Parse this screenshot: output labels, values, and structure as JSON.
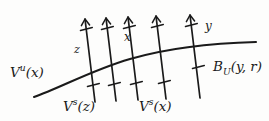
{
  "figure": {
    "kind": "mathematical-diagram",
    "background_color": "#fdfdfc",
    "ink_color": "#1a1a1a",
    "width": 269,
    "height": 121
  },
  "labels": {
    "unstable_manifold": {
      "base": "V",
      "superscript": "u",
      "argument": "(x)",
      "full": "V^u(x)"
    },
    "point_z": "z",
    "point_x": "x",
    "point_y": "y",
    "ball": {
      "base": "B",
      "subscript": "U",
      "argument": "(y, r)",
      "full": "B_U(y,r)"
    },
    "stable_manifold_z": {
      "base": "V",
      "superscript": "s",
      "argument": "(z)",
      "full": "V^s(z)"
    },
    "stable_manifold_x": {
      "base": "V",
      "superscript": "s",
      "argument": "(x)",
      "full": "V^s(x)"
    }
  },
  "geometry": {
    "main_curve": {
      "name": "unstable-manifold-curve",
      "path": "M 34 97 C 60 88, 92 70, 130 59 C 168 48, 215 43, 256 42"
    },
    "stable_lines": [
      {
        "name": "stable-line-1",
        "x_top": 85,
        "y_top": 17,
        "x_bottom": 95,
        "y_bottom": 102,
        "cross_y": 62
      },
      {
        "name": "stable-line-2",
        "x_top": 106,
        "y_top": 16,
        "x_bottom": 116,
        "y_bottom": 101,
        "cross_y": 57
      },
      {
        "name": "stable-line-3",
        "x_top": 128,
        "y_top": 15,
        "x_bottom": 138,
        "y_bottom": 100,
        "cross_y": 53
      },
      {
        "name": "stable-line-4",
        "x_top": 156,
        "y_top": 14,
        "x_bottom": 166,
        "y_bottom": 99,
        "cross_y": 49
      },
      {
        "name": "stable-line-5",
        "x_top": 190,
        "y_top": 13,
        "x_bottom": 200,
        "y_bottom": 98,
        "cross_y": 45
      }
    ]
  }
}
